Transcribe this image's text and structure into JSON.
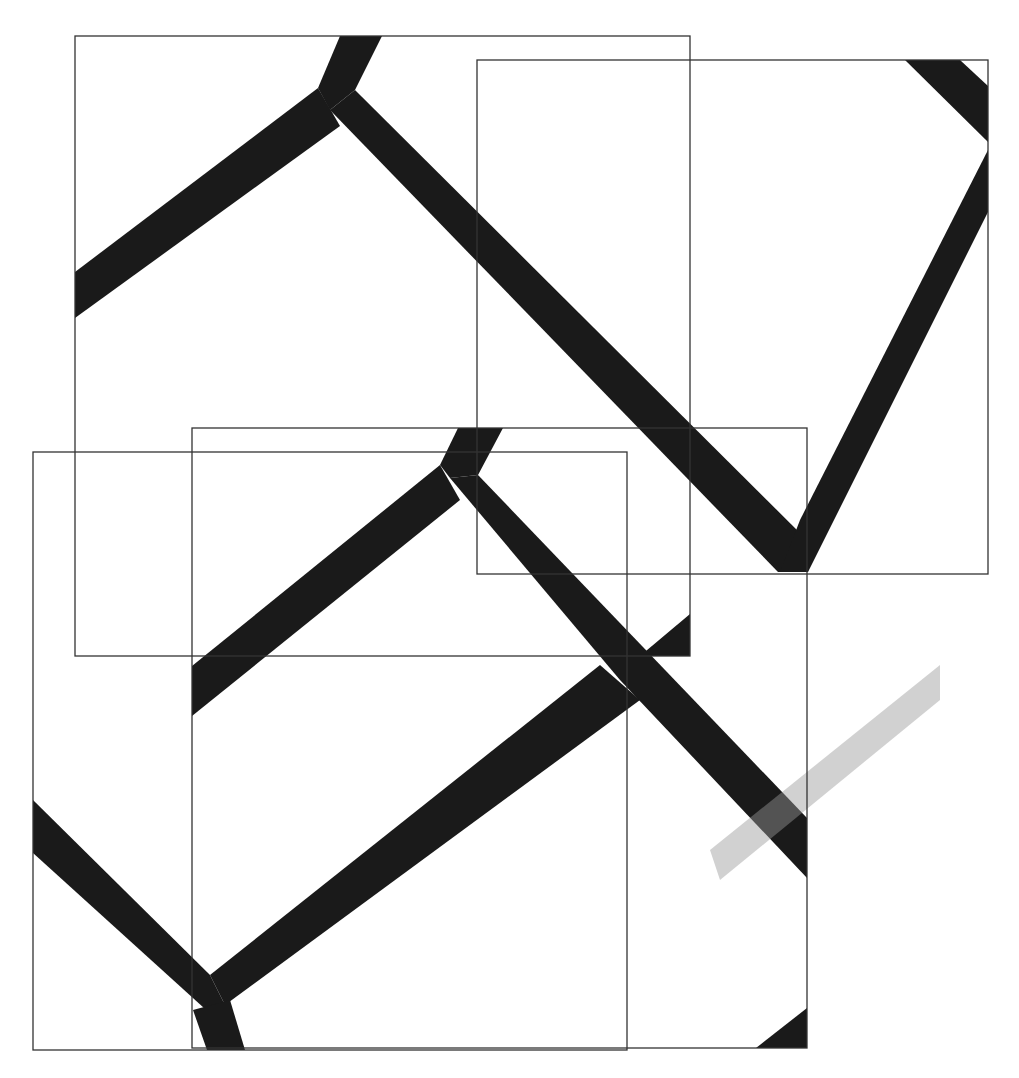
{
  "figure": {
    "width": 1019,
    "height": 1078,
    "background": "#ffffff",
    "outline_color": "#333333",
    "band_color": "#1a1a1a",
    "smudge_color": "#9a9a9a"
  },
  "tiles": [
    {
      "id": "tile-top-left",
      "x": 75,
      "y": 36,
      "w": 615,
      "h": 620
    },
    {
      "id": "tile-top-right",
      "x": 477,
      "y": 60,
      "w": 511,
      "h": 514
    },
    {
      "id": "tile-bottom-left",
      "x": 33,
      "y": 452,
      "w": 594,
      "h": 598
    },
    {
      "id": "tile-bottom-middle",
      "x": 192,
      "y": 428,
      "w": 615,
      "h": 620
    }
  ],
  "bands": [
    {
      "id": "band-top-stem",
      "points": "340,36 382,36 355,90 330,110 318,88"
    },
    {
      "id": "band-top-left-arm",
      "points": "75,272 318,88 340,126 75,318"
    },
    {
      "id": "band-top-right-arm",
      "points": "330,110 355,90 812,545 808,572 778,572"
    },
    {
      "id": "band-topright-corner",
      "points": "905,60 960,60 988,86 988,142"
    },
    {
      "id": "band-right-arm",
      "points": "988,150 988,212 808,572 780,572 800,520"
    },
    {
      "id": "band-mid-stem",
      "points": "458,428 503,428 478,475 450,478 440,465"
    },
    {
      "id": "band-mid-left-arm",
      "points": "192,666 440,465 460,500 192,716"
    },
    {
      "id": "band-mid-right-arm",
      "points": "450,478 478,475 807,818 807,878 620,680"
    },
    {
      "id": "band-r1-corner",
      "points": "690,614 690,656 640,656"
    },
    {
      "id": "band-lower-long",
      "points": "600,665 640,700 225,1005 210,975"
    },
    {
      "id": "band-lower-left-arm",
      "points": "33,800 210,975 225,1005 215,1018 33,853"
    },
    {
      "id": "band-lower-stem",
      "points": "193,1010 230,1000 245,1050 207,1050"
    },
    {
      "id": "band-bottom-right-corner",
      "points": "807,1008 807,1048 756,1048"
    }
  ],
  "smudge": {
    "id": "gray-smudge-band",
    "points": "710,850 940,665 940,700 720,880"
  }
}
